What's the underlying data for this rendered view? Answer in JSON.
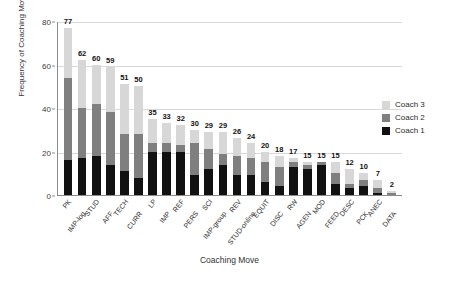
{
  "chart_data": {
    "type": "bar",
    "subtype": "stacked-bar",
    "title": "",
    "xlabel": "Coaching Move",
    "ylabel": "Frequency of Coaching Move",
    "ylim": [
      0,
      80
    ],
    "yticks": [
      0,
      20,
      40,
      60,
      80
    ],
    "grid": true,
    "legend_position": "right",
    "categories": [
      "PK",
      "IMP-log",
      "STUD",
      "AFF",
      "TECH",
      "CURR",
      "LP",
      "IMP",
      "REF",
      "PERS",
      "SCI",
      "IMP-group",
      "REV",
      "STUD-online",
      "EQUIT",
      "DISC",
      "RW",
      "AGEN",
      "MOD",
      "FEED",
      "DESC",
      "PCK",
      "ANEC",
      "DATA"
    ],
    "totals": [
      77,
      62,
      60,
      59,
      51,
      50,
      35,
      33,
      32,
      30,
      29,
      29,
      26,
      24,
      20,
      18,
      17,
      15,
      15,
      15,
      12,
      10,
      7,
      2
    ],
    "series": [
      {
        "name": "Coach 1",
        "color": "#111111",
        "values": [
          16,
          17,
          18,
          14,
          11,
          8,
          20,
          20,
          20,
          9,
          12,
          14,
          9,
          9,
          6,
          4,
          13,
          12,
          14,
          5,
          3,
          4,
          1,
          0
        ]
      },
      {
        "name": "Coach 2",
        "color": "#7f7f7f",
        "values": [
          38,
          23,
          24,
          24,
          17,
          20,
          4,
          4,
          3,
          15,
          9,
          5,
          9,
          8,
          9,
          9,
          2,
          2,
          1,
          5,
          2,
          3,
          2,
          1
        ]
      },
      {
        "name": "Coach 3",
        "color": "#d7d7d7",
        "values": [
          23,
          22,
          18,
          21,
          23,
          22,
          11,
          9,
          9,
          6,
          8,
          10,
          8,
          7,
          5,
          5,
          2,
          1,
          0,
          5,
          7,
          3,
          4,
          1
        ]
      }
    ]
  },
  "legend": {
    "items": [
      {
        "label": "Coach 3",
        "color": "#d7d7d7"
      },
      {
        "label": "Coach 2",
        "color": "#7f7f7f"
      },
      {
        "label": "Coach 1",
        "color": "#111111"
      }
    ]
  },
  "axes": {
    "y_title": "Frequency of Coaching Move",
    "x_title": "Coaching Move",
    "y_tick_labels": [
      "0",
      "20",
      "40",
      "60",
      "80"
    ]
  }
}
